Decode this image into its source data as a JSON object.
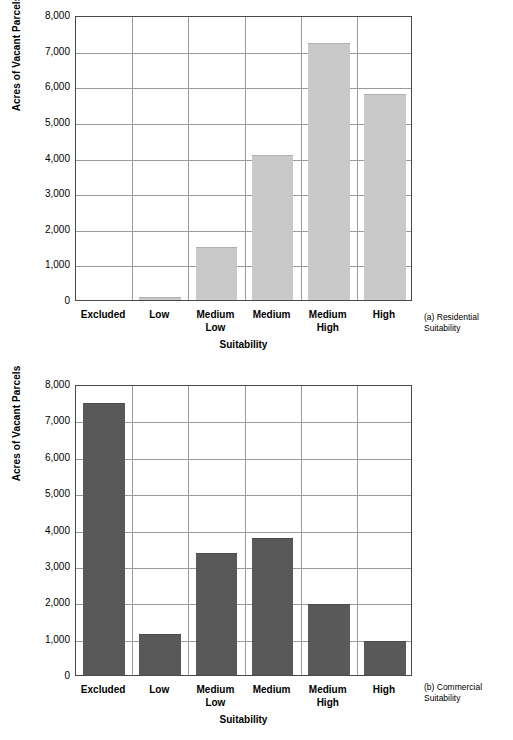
{
  "chart_data": [
    {
      "id": "residential",
      "type": "bar",
      "title": "",
      "caption": "(a) Residential\nSuitability",
      "xlabel": "Suitability",
      "ylabel": "Acres of Vacant Parcels",
      "categories": [
        "Excluded",
        "Low",
        "Medium\nLow",
        "Medium",
        "Medium\nHigh",
        "High"
      ],
      "values": [
        0,
        70,
        1450,
        4050,
        7180,
        5750
      ],
      "ylim": [
        0,
        8000
      ],
      "ytick_labels": [
        "8,000",
        "7,000",
        "6,000",
        "5,000",
        "4,000",
        "3,000",
        "2,000",
        "1,000",
        "0"
      ],
      "ytick_values": [
        8000,
        7000,
        6000,
        5000,
        4000,
        3000,
        2000,
        1000,
        0
      ],
      "bar_color": "#c9c9c9",
      "bar_edge_color": "#b0b0b0",
      "grid": "horizontal-and-vertical",
      "legend": "none"
    },
    {
      "id": "commercial",
      "type": "bar",
      "title": "",
      "caption": "(b) Commercial\nSuitability",
      "xlabel": "Suitability",
      "ylabel": "Acres of Vacant Parcels",
      "categories": [
        "Excluded",
        "Low",
        "Medium\nLow",
        "Medium",
        "Medium\nHigh",
        "High"
      ],
      "values": [
        7450,
        1090,
        3320,
        3750,
        1920,
        900
      ],
      "ylim": [
        0,
        8000
      ],
      "ytick_labels": [
        "8,000",
        "7,000",
        "6,000",
        "5,000",
        "4,000",
        "3,000",
        "2,000",
        "1,000",
        "0"
      ],
      "ytick_values": [
        8000,
        7000,
        6000,
        5000,
        4000,
        3000,
        2000,
        1000,
        0
      ],
      "bar_color": "#595959",
      "bar_edge_color": "#4a4a4a",
      "grid": "horizontal-and-vertical",
      "legend": "none"
    }
  ],
  "figure_a": {
    "ylabel": "Acres of Vacant Parcels",
    "xlabel": "Suitability",
    "caption": "(a) Residential\nSuitability",
    "yticks": [
      "8,000",
      "7,000",
      "6,000",
      "5,000",
      "4,000",
      "3,000",
      "2,000",
      "1,000",
      "0"
    ],
    "xticks": [
      "Excluded",
      "Low",
      "Medium\nLow",
      "Medium",
      "Medium\nHigh",
      "High"
    ]
  },
  "figure_b": {
    "ylabel": "Acres of Vacant Parcels",
    "xlabel": "Suitability",
    "caption": "(b) Commercial\nSuitability",
    "yticks": [
      "8,000",
      "7,000",
      "6,000",
      "5,000",
      "4,000",
      "3,000",
      "2,000",
      "1,000",
      "0"
    ],
    "xticks": [
      "Excluded",
      "Low",
      "Medium\nLow",
      "Medium",
      "Medium\nHigh",
      "High"
    ]
  }
}
